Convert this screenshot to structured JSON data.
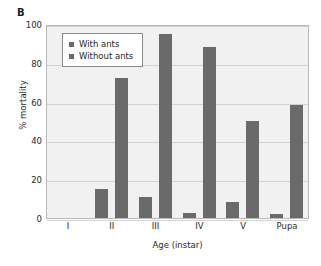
{
  "panel": {
    "label": "B"
  },
  "chart_data": {
    "type": "bar",
    "title": "",
    "xlabel": "Age (instar)",
    "ylabel": "% mortality",
    "categories": [
      "I",
      "II",
      "III",
      "IV",
      "V",
      "Pupa"
    ],
    "series": [
      {
        "name": "With ants",
        "values": [
          0,
          15,
          11,
          2.5,
          8,
          2
        ]
      },
      {
        "name": "Without ants",
        "values": [
          0,
          72,
          95,
          88,
          50,
          58
        ]
      }
    ],
    "ylim": [
      0,
      100
    ],
    "yticks": [
      0,
      20,
      40,
      60,
      80,
      100
    ],
    "grid": true,
    "legend_position": "top-left",
    "bar_color": "#6a6a6a",
    "plot_background": "#f1f1f1",
    "gridline_color": "#d2d2d2"
  },
  "legend": {
    "entries": [
      "With ants",
      "Without ants"
    ]
  }
}
